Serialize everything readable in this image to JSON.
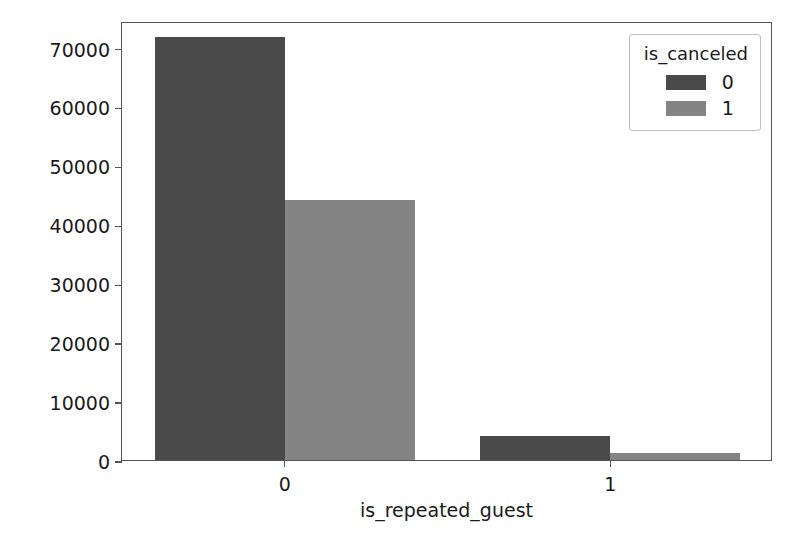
{
  "chart_data": {
    "type": "bar",
    "title": "",
    "xlabel": "is_repeated_guest",
    "ylabel": "count",
    "categories": [
      "0",
      "1"
    ],
    "series": [
      {
        "name": "0",
        "values": [
          71800,
          4050
        ],
        "color": "#4a4a4a"
      },
      {
        "name": "1",
        "values": [
          44200,
          1200
        ],
        "color": "#848484"
      }
    ],
    "legend": {
      "title": "is_canceled",
      "position": "upper right",
      "entries": [
        {
          "label": "0",
          "color": "#4a4a4a"
        },
        {
          "label": "1",
          "color": "#848484"
        }
      ]
    },
    "yticks": [
      0,
      10000,
      20000,
      30000,
      40000,
      50000,
      60000,
      70000
    ],
    "ytick_labels": [
      "0",
      "10000",
      "20000",
      "30000",
      "40000",
      "50000",
      "60000",
      "70000"
    ],
    "xtick_labels": [
      "0",
      "1"
    ],
    "ylim": [
      0,
      74500
    ],
    "xlim": [
      -0.5,
      1.5
    ],
    "grid": false,
    "bar_width": 0.8,
    "n_groups": 2
  },
  "figure": {
    "background_color": "#ffffff",
    "axes_edge_color": "#555555",
    "text_color": "#1a1a1a"
  }
}
